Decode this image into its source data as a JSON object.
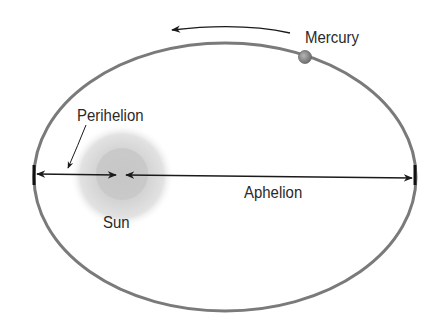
{
  "diagram": {
    "labels": {
      "planet": "Mercury",
      "star": "Sun",
      "perihelion": "Perihelion",
      "aphelion": "Aphelion"
    },
    "colors": {
      "orbit": "#7a7a7a",
      "arrow": "#1a1a1a",
      "sun_halo": "#d9d9d9",
      "sun_core": "#c2c2c2",
      "planet": "#8e8e8e",
      "text": "#2a2a2a"
    },
    "geometry": {
      "orbit_center": [
        225,
        177
      ],
      "orbit_rx": 191,
      "orbit_ry": 134,
      "sun_center": [
        122,
        175
      ],
      "planet_center": [
        305,
        57
      ],
      "axis_y": 175
    }
  }
}
